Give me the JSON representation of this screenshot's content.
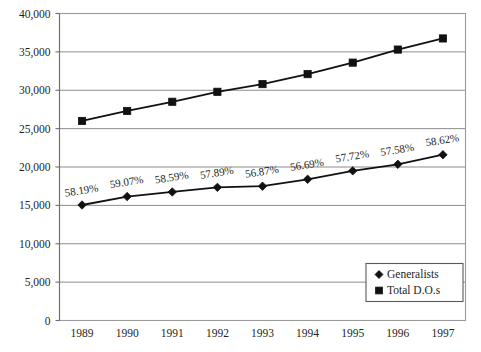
{
  "chart_data": {
    "type": "line",
    "title": "",
    "subtitle": "",
    "xlabel": "",
    "ylabel": "",
    "categories": [
      "1989",
      "1990",
      "1991",
      "1992",
      "1993",
      "1994",
      "1995",
      "1996",
      "1997"
    ],
    "x": [
      1989,
      1990,
      1991,
      1992,
      1993,
      1994,
      1995,
      1996,
      1997
    ],
    "ylim": [
      0,
      40000
    ],
    "ytick_values": [
      0,
      5000,
      10000,
      15000,
      20000,
      25000,
      30000,
      35000,
      40000
    ],
    "ytick_labels": [
      "0",
      "5,000",
      "10,000",
      "15,000",
      "20,000",
      "25,000",
      "30,000",
      "35,000",
      "40,000"
    ],
    "grid": "horizontal",
    "legend_position": "bottom-right",
    "series": [
      {
        "name": "Generalists",
        "marker": "diamond",
        "values": [
          15050,
          16150,
          16750,
          17350,
          17500,
          18400,
          19500,
          20350,
          21600
        ],
        "point_labels": [
          "58.19%",
          "59.07%",
          "58.59%",
          "57.89%",
          "56.87%",
          "56.69%",
          "57.72%",
          "57.58%",
          "58.62%"
        ]
      },
      {
        "name": "Total D.O.s",
        "marker": "square",
        "values": [
          26000,
          27300,
          28500,
          29800,
          30800,
          32100,
          33600,
          35300,
          36750
        ],
        "point_labels": [
          "",
          "",
          "",
          "",
          "",
          "",
          "",
          "",
          ""
        ]
      }
    ],
    "colors": {
      "series_line": "#111111",
      "marker": "#111111",
      "gridline": "#8c8c8c",
      "axis": "#6e6e6e",
      "frame": "#9a9a9a",
      "text": "#231f20",
      "background": "#ffffff"
    }
  },
  "legend": {
    "items": [
      {
        "label": "Generalists",
        "marker": "diamond"
      },
      {
        "label": "Total D.O.s",
        "marker": "square"
      }
    ]
  }
}
